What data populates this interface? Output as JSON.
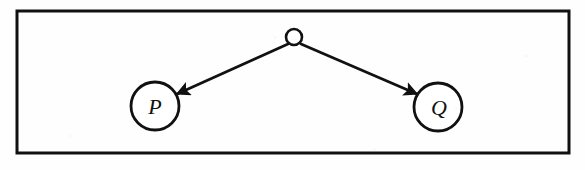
{
  "figure": {
    "kind": "tree-diagram",
    "title": "",
    "background_color": "#fefefe",
    "stroke_color": "#111111",
    "frame": {
      "name": "figure-border",
      "x": 17,
      "y": 11,
      "width": 552,
      "height": 142,
      "stroke_width": 3,
      "fill": "none"
    },
    "root_node": {
      "label": "",
      "cx": 294,
      "cy": 37,
      "r": 8,
      "stroke_width": 2.6,
      "fill": "#ffffff"
    },
    "nodes": [
      {
        "id": "p",
        "label": "P",
        "cx": 155,
        "cy": 106,
        "r": 24,
        "stroke_width": 2.8,
        "fill": "#ffffff",
        "label_dx": 0,
        "label_dy": 8
      },
      {
        "id": "q",
        "label": "Q",
        "cx": 438,
        "cy": 107,
        "r": 24,
        "stroke_width": 2.8,
        "fill": "#ffffff",
        "label_dx": 1,
        "label_dy": 8
      }
    ],
    "edges": [
      {
        "id": "root-to-p",
        "from": "root",
        "to": "p",
        "x1": 288,
        "y1": 44,
        "x2": 177,
        "y2": 94,
        "stroke_width": 2.8,
        "arrowhead": "filled-triangle"
      },
      {
        "id": "root-to-q",
        "from": "root",
        "to": "q",
        "x1": 301,
        "y1": 44,
        "x2": 417,
        "y2": 94,
        "stroke_width": 2.8,
        "arrowhead": "filled-triangle"
      }
    ]
  }
}
